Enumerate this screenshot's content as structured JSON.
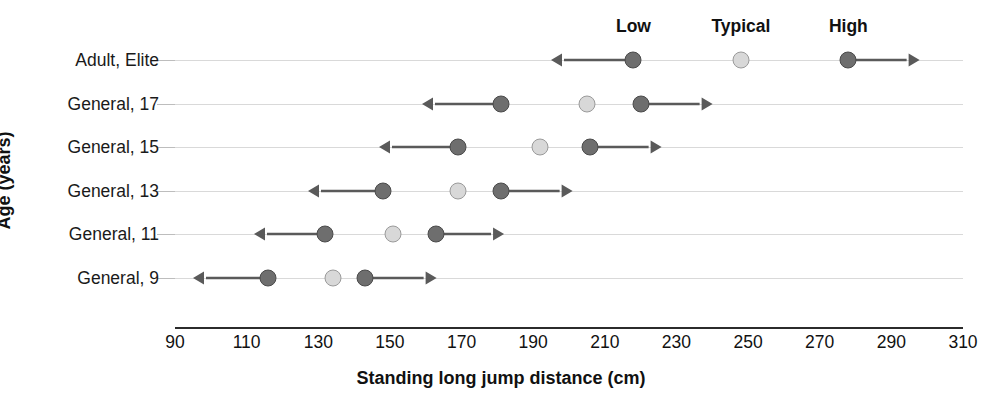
{
  "chart_data": {
    "type": "scatter",
    "title": "",
    "xlabel": "Standing long jump distance (cm)",
    "ylabel": "Age (years)",
    "xlim": [
      90,
      310
    ],
    "xticks": [
      90,
      110,
      130,
      150,
      170,
      190,
      210,
      230,
      250,
      270,
      290,
      310
    ],
    "grid": true,
    "legend_position": "top",
    "column_headers": [
      "Low",
      "Typical",
      "High"
    ],
    "header_x_positions": [
      218,
      248,
      278
    ],
    "categories": [
      "Adult, Elite",
      "General, 17",
      "General, 15",
      "General, 13",
      "General, 11",
      "General, 9"
    ],
    "series": [
      {
        "name": "Low",
        "marker": "dark",
        "values": [
          218,
          181,
          169,
          148,
          132,
          116
        ]
      },
      {
        "name": "Typical",
        "marker": "light",
        "values": [
          248,
          205,
          192,
          169,
          151,
          134
        ]
      },
      {
        "name": "High",
        "marker": "dark",
        "values": [
          278,
          220,
          206,
          181,
          163,
          143
        ]
      }
    ],
    "low_arrow_ends": [
      195,
      159,
      147,
      127,
      112,
      95
    ],
    "high_arrow_ends": [
      298,
      240,
      226,
      201,
      182,
      163
    ],
    "colors": {
      "dark_marker_fill": "#6e6e6e",
      "dark_marker_edge": "#4a4a4a",
      "light_marker_fill": "#d8d8d8",
      "light_marker_edge": "#9a9a9a",
      "arrow": "#5a5a5a",
      "gridline": "#d9d9d9",
      "axis": "#2b2b2b",
      "text": "#111111",
      "background": "#ffffff"
    }
  }
}
